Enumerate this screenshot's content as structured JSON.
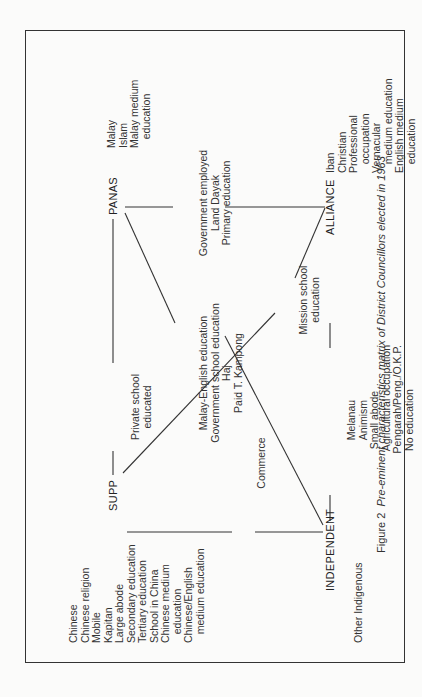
{
  "figure": {
    "caption_label": "Figure 2",
    "caption_text": "Pre-eminent characteristics matrix of District Councillors elected in 1963",
    "nodes": {
      "panas": "PANAS",
      "supp": "SUPP",
      "independent": "INDEPENDENT",
      "alliance": "ALLIANCE"
    },
    "groups": {
      "panas": [
        "Malay",
        "Islam",
        "Malay medium",
        "   education"
      ],
      "supp": [
        "Chinese",
        "Chinese religion",
        "Mobile",
        "Kapitan",
        "Large abode",
        "Secondary education",
        "Tertiary education",
        "School in China",
        "Chinese medium",
        "   education",
        "Chinese/English",
        "   medium education"
      ],
      "independent": [
        "Other Indigenous"
      ],
      "alliance": [
        "Iban",
        "Christian",
        "Professional",
        "   occupation",
        "Vernacular",
        "   medium education",
        "English medium",
        "   education"
      ]
    },
    "links": {
      "supp_panas": [
        "Private school",
        "educated"
      ],
      "supp_independent": [
        "Commerce"
      ],
      "panas_independent": [
        "Malay-English education",
        "Government school education",
        "Haj",
        "Paid T. Kampong"
      ],
      "supp_alliance": [
        "Mission school",
        "education"
      ],
      "panas_alliance": [
        "Government employed",
        "Land Dayak",
        "Primary education"
      ],
      "independent_alliance": [
        "Melanau",
        "Animism",
        "Small abode",
        "Agricultural occupation",
        "Pengarah/Peng./O.K.P.",
        "No education"
      ]
    }
  }
}
